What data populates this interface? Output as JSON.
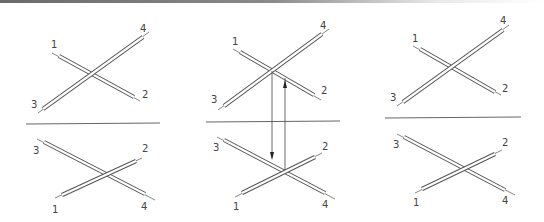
{
  "diagram": {
    "colors": {
      "stroke": "#555555",
      "rod_fill": "#ffffff",
      "background": "#ffffff"
    },
    "panels": [
      {
        "id": "left",
        "top": {
          "labels": {
            "1": "1",
            "2": "2",
            "3": "3",
            "4": "4"
          }
        },
        "bottom": {
          "labels": {
            "1": "1",
            "2": "2",
            "3": "3",
            "4": "4"
          }
        }
      },
      {
        "id": "middle",
        "top": {
          "labels": {
            "1": "1",
            "2": "2",
            "3": "3",
            "4": "4"
          }
        },
        "bottom": {
          "labels": {
            "1": "1",
            "2": "2",
            "3": "3",
            "4": "4"
          }
        },
        "arrows": [
          {
            "direction": "down",
            "from": "top-crossing",
            "to": "bottom-rod-3-4"
          },
          {
            "direction": "up",
            "from": "bottom-crossing",
            "to": "top-rod-1-2"
          }
        ]
      },
      {
        "id": "right",
        "top": {
          "labels": {
            "1": "1",
            "2": "2",
            "3": "3",
            "4": "4"
          }
        },
        "bottom": {
          "labels": {
            "1": "1",
            "2": "2",
            "3": "3",
            "4": "4"
          }
        }
      }
    ]
  }
}
